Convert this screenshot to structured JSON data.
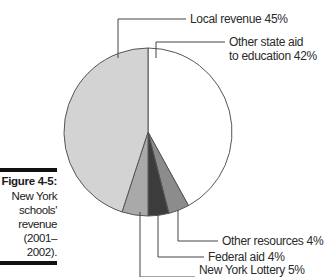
{
  "caption": {
    "figure": "Figure 4-5:",
    "lines": [
      "New York",
      "schools'",
      "revenue",
      "(2001–2002)."
    ]
  },
  "colors": {
    "outline": "#555555",
    "bar": "#111111",
    "slices": [
      "#ffffff",
      "#8c8c8c",
      "#3c3c3c",
      "#a9a9a9",
      "#d3d3d3"
    ]
  },
  "chart_data": {
    "type": "pie",
    "categories": [
      "Other state aid to education",
      "Other resources",
      "Federal aid",
      "New York Lottery",
      "Local revenue"
    ],
    "values": [
      42,
      4,
      4,
      5,
      45
    ],
    "unit": "%",
    "labels": [
      "Other state aid to education 42%",
      "Other resources 4%",
      "Federal aid 4%",
      "New York Lottery 5%",
      "Local revenue 45%"
    ],
    "start_angle": "12 o'clock",
    "direction": "clockwise",
    "legend": "none (callout leader lines)"
  },
  "labels": {
    "local": "Local revenue 45%",
    "state_line1": "Other state aid",
    "state_line2": "to education 42%",
    "other": "Other resources 4%",
    "federal": "Federal aid 4%",
    "lottery": "New York Lottery 5%"
  }
}
